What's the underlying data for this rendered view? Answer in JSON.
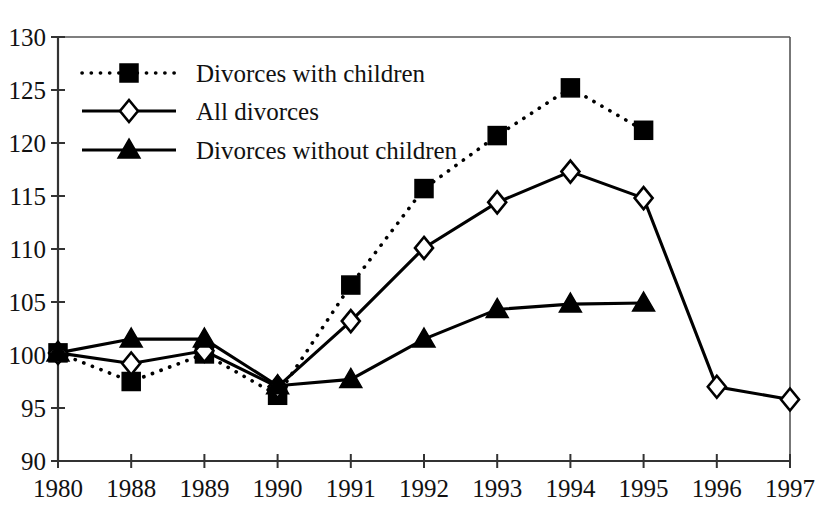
{
  "chart_data": {
    "type": "line",
    "title": "",
    "subtitle": "",
    "xlabel": "",
    "ylabel": "",
    "categories": [
      "1980",
      "1988",
      "1989",
      "1990",
      "1991",
      "1992",
      "1993",
      "1994",
      "1995",
      "1996",
      "1997"
    ],
    "x_tick_labels": [
      "1980",
      "1988",
      "1989",
      "1990",
      "1991",
      "1992",
      "1993",
      "1994",
      "1995",
      "1996",
      "1997"
    ],
    "y_tick_labels": [
      "90",
      "95",
      "100",
      "105",
      "110",
      "115",
      "120",
      "125",
      "130"
    ],
    "y_ticks": [
      90,
      95,
      100,
      105,
      110,
      115,
      120,
      125,
      130
    ],
    "ylim": [
      90,
      130
    ],
    "grid": false,
    "legend_position": "top-left",
    "series": [
      {
        "name": "Divorces with children",
        "marker": "filled-square",
        "line_style": "dotted",
        "color": "#000000",
        "x": [
          "1980",
          "1988",
          "1989",
          "1990",
          "1991",
          "1992",
          "1993",
          "1994",
          "1995"
        ],
        "values": [
          100.2,
          97.5,
          100.1,
          96.2,
          106.6,
          115.7,
          120.7,
          125.2,
          121.2
        ]
      },
      {
        "name": "All divorces",
        "marker": "open-diamond",
        "line_style": "solid",
        "color": "#000000",
        "x": [
          "1980",
          "1988",
          "1989",
          "1990",
          "1991",
          "1992",
          "1993",
          "1994",
          "1995",
          "1996",
          "1997"
        ],
        "values": [
          100.2,
          99.2,
          100.4,
          97.0,
          103.2,
          110.1,
          114.4,
          117.3,
          114.8,
          97.0,
          95.8
        ]
      },
      {
        "name": "Divorces without children",
        "marker": "filled-triangle",
        "line_style": "solid",
        "color": "#000000",
        "x": [
          "1980",
          "1988",
          "1989",
          "1990",
          "1991",
          "1992",
          "1993",
          "1994",
          "1995"
        ],
        "values": [
          100.2,
          101.5,
          101.5,
          97.1,
          97.7,
          101.5,
          104.3,
          104.8,
          104.9
        ]
      }
    ]
  },
  "legend": {
    "entries": [
      {
        "label": "Divorces with children"
      },
      {
        "label": "All divorces"
      },
      {
        "label": "Divorces without children"
      }
    ]
  }
}
